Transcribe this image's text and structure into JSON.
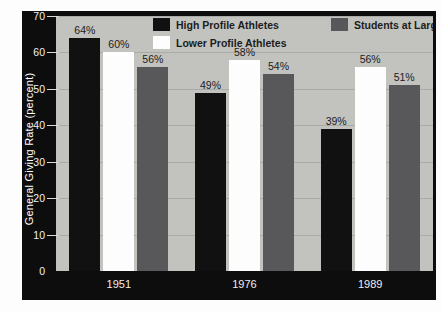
{
  "chart_data": {
    "type": "bar",
    "title": "",
    "xlabel": "",
    "ylabel": "General Giving Rate (percent)",
    "categories": [
      "1951",
      "1976",
      "1989"
    ],
    "series": [
      {
        "name": "High Profile Athletes",
        "color": "#111111",
        "values": [
          64,
          60,
          56
        ]
      },
      {
        "name": "Lower Profile Athletes",
        "color": "#fdfdfd",
        "values": [
          60,
          58,
          56
        ]
      },
      {
        "name": "Students at Large",
        "color": "#58585a",
        "values": [
          56,
          54,
          51
        ]
      }
    ],
    "groups": [
      {
        "category": "1951",
        "bars": [
          {
            "series": "High Profile Athletes",
            "value": 64,
            "label": "64%"
          },
          {
            "series": "Lower Profile Athletes",
            "value": 60,
            "label": "60%"
          },
          {
            "series": "Students at Large",
            "value": 56,
            "label": "56%"
          }
        ]
      },
      {
        "category": "1976",
        "bars": [
          {
            "series": "High Profile Athletes",
            "value": 49,
            "label": "49%"
          },
          {
            "series": "Lower Profile Athletes",
            "value": 58,
            "label": "58%"
          },
          {
            "series": "Students at Large",
            "value": 54,
            "label": "54%"
          }
        ]
      },
      {
        "category": "1989",
        "bars": [
          {
            "series": "High Profile Athletes",
            "value": 39,
            "label": "39%"
          },
          {
            "series": "Lower Profile Athletes",
            "value": 56,
            "label": "56%"
          },
          {
            "series": "Students at Large",
            "value": 51,
            "label": "51%"
          }
        ]
      }
    ],
    "ylim": [
      0,
      70
    ],
    "ytick_step": 10,
    "yticks": [
      0,
      10,
      20,
      30,
      40,
      50,
      60,
      70
    ],
    "ytick_labels": [
      "0",
      "10",
      "20",
      "30",
      "40",
      "50",
      "60",
      "70"
    ],
    "grid": true,
    "legend_position": "top-inside"
  },
  "legend": {
    "row1": [
      {
        "label": "High Profile Athletes",
        "swatch": "dark"
      },
      {
        "label": "Students at Large",
        "swatch": "grey"
      }
    ],
    "row2": [
      {
        "label": "Lower Profile Athletes",
        "swatch": "white"
      }
    ]
  },
  "colors": {
    "plot_background": "#c2c3bf",
    "frame": "#0d0d0d",
    "gridline": "#aaaba7",
    "series_dark": "#111111",
    "series_white": "#fdfdfd",
    "series_grey": "#58585a",
    "axis_text": "#f2f2f2",
    "label_text": "#1b1b1b"
  }
}
